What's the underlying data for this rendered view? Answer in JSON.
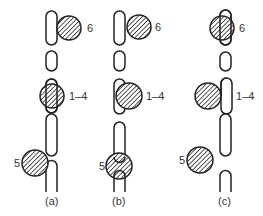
{
  "figure": {
    "panels": [
      {
        "id": "a",
        "caption": "(a)",
        "labels": {
          "top": "6",
          "middle": "1–4",
          "bottom": "5"
        }
      },
      {
        "id": "b",
        "caption": "(b)",
        "labels": {
          "top": "6",
          "middle": "1–4",
          "bottom": "5"
        }
      },
      {
        "id": "c",
        "caption": "(c)",
        "labels": {
          "top": "6",
          "middle": "1–4",
          "bottom": "5"
        }
      }
    ],
    "colors": {
      "stroke": "#222222",
      "hatch": "#222222",
      "background": "#ffffff",
      "text": "#333333"
    }
  }
}
